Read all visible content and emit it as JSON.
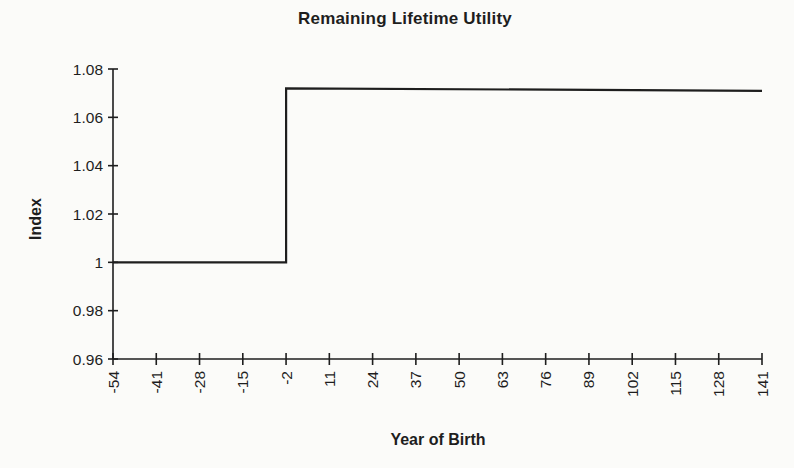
{
  "figure": {
    "background_color": "#fbfbf9",
    "ink_color": "#1e1e1e"
  },
  "chart_data": {
    "type": "line",
    "subtype": "step",
    "title": "Remaining Lifetime Utility",
    "xlabel": "Year of Birth",
    "ylabel": "Index",
    "xlim": [
      -54,
      141
    ],
    "ylim": [
      0.96,
      1.08
    ],
    "grid": false,
    "legend": "none",
    "x_ticks": [
      -54,
      -41,
      -28,
      -15,
      -2,
      11,
      24,
      37,
      50,
      63,
      76,
      89,
      102,
      115,
      128,
      141
    ],
    "y_ticks": [
      {
        "value": 1.08,
        "label": "1.08"
      },
      {
        "value": 1.06,
        "label": "1.06"
      },
      {
        "value": 1.04,
        "label": "1.04"
      },
      {
        "value": 1.02,
        "label": "1.02"
      },
      {
        "value": 1.0,
        "label": "1"
      },
      {
        "value": 0.98,
        "label": "0.98"
      },
      {
        "value": 0.96,
        "label": "0.96"
      }
    ],
    "series": [
      {
        "name": "Remaining Lifetime Utility",
        "color": "#1e1e1e",
        "points": [
          [
            -54,
            1.0
          ],
          [
            -2,
            1.0
          ],
          [
            -2,
            1.072
          ],
          [
            141,
            1.071
          ]
        ]
      }
    ]
  }
}
